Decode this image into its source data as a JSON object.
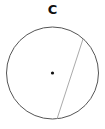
{
  "diagram": {
    "label": "C",
    "circle": {
      "cx": 52.5,
      "cy": 73,
      "r": 46,
      "stroke": "#555555"
    },
    "center_point": {
      "cx": 52.5,
      "cy": 73,
      "r": 1.6,
      "fill": "#111111"
    },
    "chord": {
      "x1": 83,
      "y1": 39,
      "x2": 57,
      "y2": 119,
      "stroke": "#aaaaaa"
    }
  }
}
